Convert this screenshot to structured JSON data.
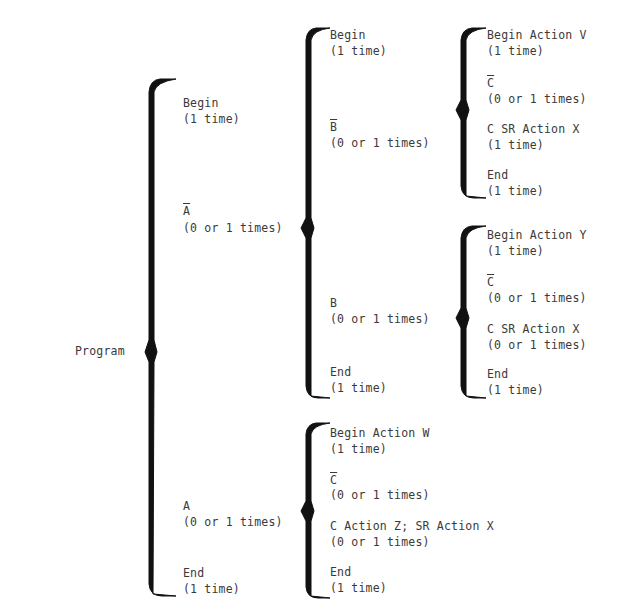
{
  "diagram": {
    "type": "warnier-orr",
    "root": {
      "label": "Program",
      "children": [
        {
          "label": "Begin",
          "repeat": "(1 time)"
        },
        {
          "label": "A",
          "negated": true,
          "repeat": "(0 or 1 times)",
          "children": [
            {
              "label": "Begin",
              "repeat": "(1 time)"
            },
            {
              "label": "B",
              "negated": true,
              "repeat": "(0 or 1 times)",
              "children": [
                {
                  "label": "Begin Action V",
                  "repeat": "(1 time)"
                },
                {
                  "label": "C",
                  "negated": true,
                  "repeat": "(0 or 1 times)"
                },
                {
                  "label": "C SR Action X",
                  "repeat": "(1 time)"
                },
                {
                  "label": "End",
                  "repeat": "(1 time)"
                }
              ]
            },
            {
              "label": "B",
              "negated": false,
              "repeat": "(0 or 1 times)",
              "children": [
                {
                  "label": "Begin Action Y",
                  "repeat": "(1 time)"
                },
                {
                  "label": "C",
                  "negated": true,
                  "repeat": "(0 or 1 times)"
                },
                {
                  "label": "C SR Action X",
                  "repeat": "(0 or 1 times)"
                },
                {
                  "label": "End",
                  "repeat": "(1 time)"
                }
              ]
            },
            {
              "label": "End",
              "repeat": "(1 time)"
            }
          ]
        },
        {
          "label": "A",
          "negated": false,
          "repeat": "(0 or 1 times)",
          "children": [
            {
              "label": "Begin Action W",
              "repeat": "(1 time)"
            },
            {
              "label": "C",
              "negated": true,
              "repeat": "(0 or 1 times)"
            },
            {
              "label": "C Action Z; SR Action X",
              "repeat": "(0 or 1 times)"
            },
            {
              "label": "End",
              "repeat": "(1 time)"
            }
          ]
        },
        {
          "label": "End",
          "repeat": "(1 time)"
        }
      ]
    }
  }
}
